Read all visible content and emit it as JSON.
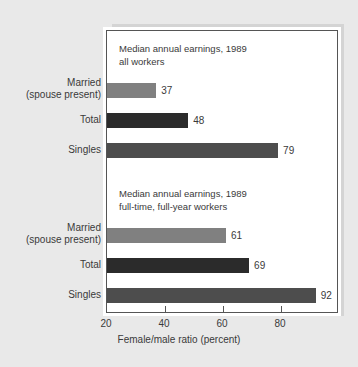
{
  "chart_data": {
    "type": "bar",
    "orientation": "horizontal",
    "title": "",
    "xlabel": "Female/male ratio (percent)",
    "ylabel": "",
    "xlim": [
      20,
      100
    ],
    "xticks": [
      20,
      40,
      60,
      80
    ],
    "grid": false,
    "legend": "none",
    "groups": [
      {
        "annotation": "Median annual earnings, 1989\nall workers",
        "annotation_line1": "Median annual earnings, 1989",
        "annotation_line2": "all workers",
        "categories": [
          "Married\n(spouse present)",
          "Total",
          "Singles"
        ],
        "values": [
          37,
          48,
          79
        ],
        "colors": [
          "#808080",
          "#2b2b2b",
          "#4d4d4d"
        ]
      },
      {
        "annotation": "Median annual earnings, 1989\nfull-time, full-year workers",
        "annotation_line1": "Median annual earnings, 1989",
        "annotation_line2": "full-time, full-year workers",
        "categories": [
          "Married\n(spouse present)",
          "Total",
          "Singles"
        ],
        "values": [
          61,
          69,
          92
        ],
        "colors": [
          "#808080",
          "#2b2b2b",
          "#4d4d4d"
        ]
      }
    ],
    "bars": [
      {
        "group": 0,
        "category": "Married\n(spouse present)",
        "value": 37,
        "label": "37",
        "color": "#808080"
      },
      {
        "group": 0,
        "category": "Total",
        "value": 48,
        "label": "48",
        "color": "#2b2b2b"
      },
      {
        "group": 0,
        "category": "Singles",
        "value": 79,
        "label": "79",
        "color": "#4d4d4d"
      },
      {
        "group": 1,
        "category": "Married\n(spouse present)",
        "value": 61,
        "label": "61",
        "color": "#808080"
      },
      {
        "group": 1,
        "category": "Total",
        "value": 69,
        "label": "69",
        "color": "#2b2b2b"
      },
      {
        "group": 1,
        "category": "Singles",
        "value": 92,
        "label": "92",
        "color": "#4d4d4d"
      }
    ]
  },
  "axis": {
    "x_title": "Female/male ratio (percent)",
    "tick_labels": [
      "20",
      "40",
      "60",
      "80"
    ]
  },
  "annotations": {
    "group1_line1": "Median annual earnings, 1989",
    "group1_line2": "all workers",
    "group2_line1": "Median annual earnings, 1989",
    "group2_line2": "full-time, full-year workers"
  },
  "categories": {
    "married_line1": "Married",
    "married_line2": "(spouse present)",
    "total": "Total",
    "singles": "Singles"
  },
  "values": {
    "g1_married": "37",
    "g1_total": "48",
    "g1_singles": "79",
    "g2_married": "61",
    "g2_total": "69",
    "g2_singles": "92"
  },
  "colors": {
    "background": "#e9e9e9",
    "plot_background": "#ffffff",
    "frame": "#555555",
    "shadow_panel": "#d4d4d4",
    "bar_married": "#808080",
    "bar_total": "#2b2b2b",
    "bar_singles": "#4d4d4d",
    "text": "#3a3a3a"
  }
}
